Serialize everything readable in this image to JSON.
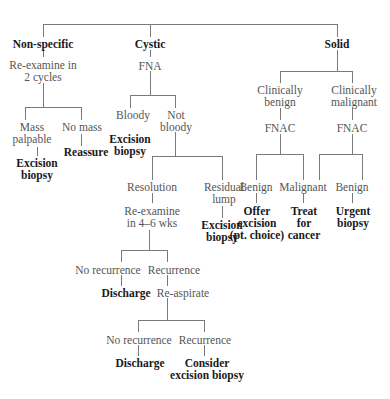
{
  "diagram": {
    "nodes": {
      "nonspecific": {
        "text": "Non-specific",
        "bold": true
      },
      "cystic": {
        "text": "Cystic",
        "bold": true
      },
      "solid": {
        "text": "Solid",
        "bold": true
      },
      "reexamine_2_cycles": {
        "text": "Re-examine in\n2 cycles"
      },
      "mass_palpable": {
        "text": "Mass\npalpable"
      },
      "no_mass": {
        "text": "No mass"
      },
      "excision_biopsy_1": {
        "text": "Excision\nbiopsy",
        "bold": true
      },
      "reassure": {
        "text": "Reassure",
        "bold": true
      },
      "fna": {
        "text": "FNA"
      },
      "bloody": {
        "text": "Bloody"
      },
      "not_bloody": {
        "text": "Not\nbloody"
      },
      "excision_biopsy_2": {
        "text": "Excision\nbiopsy",
        "bold": true
      },
      "resolution": {
        "text": "Resolution"
      },
      "residual_lump": {
        "text": "Residual\nlump"
      },
      "reexamine_4_6": {
        "text": "Re-examine\nin 4–6 wks"
      },
      "excision_biopsy_3": {
        "text": "Excision\nbiopsy",
        "bold": true
      },
      "no_recurrence_1": {
        "text": "No recurrence"
      },
      "recurrence_1": {
        "text": "Recurrence"
      },
      "discharge_1": {
        "text": "Discharge",
        "bold": true
      },
      "reaspirate": {
        "text": "Re-aspirate"
      },
      "no_recurrence_2": {
        "text": "No recurrence"
      },
      "recurrence_2": {
        "text": "Recurrence"
      },
      "discharge_2": {
        "text": "Discharge",
        "bold": true
      },
      "consider_excision": {
        "text": "Consider\nexcision biopsy",
        "bold": true
      },
      "clin_benign": {
        "text": "Clinically\nbenign"
      },
      "clin_malignant": {
        "text": "Clinically\nmalignant"
      },
      "fnac_1": {
        "text": "FNAC"
      },
      "fnac_2": {
        "text": "FNAC"
      },
      "benign_1": {
        "text": "Benign"
      },
      "malignant": {
        "text": "Malignant"
      },
      "benign_2": {
        "text": "Benign"
      },
      "offer_excision": {
        "text": "Offer\nexcision\n(pt. choice)",
        "bold": true
      },
      "treat_cancer": {
        "text": "Treat\nfor\ncancer",
        "bold": true
      },
      "urgent_biopsy": {
        "text": "Urgent\nbiopsy",
        "bold": true
      }
    },
    "colors": {
      "line": "#7a7a7a",
      "text": "#555555",
      "bold_text": "#1a1a1a"
    }
  }
}
